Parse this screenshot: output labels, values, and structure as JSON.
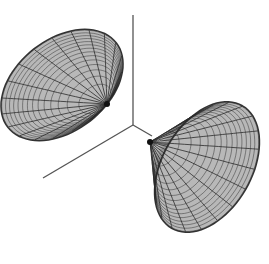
{
  "figure": {
    "background": "#ffffff",
    "surface_fill": "#b8b8b8",
    "surface_edge_dark": "#333333",
    "mesh_color": "#2a2a2a",
    "axis_color": "#555555",
    "axes": {
      "origin": [
        133,
        125
      ],
      "z_end": [
        133,
        15
      ],
      "x_end": [
        43,
        178
      ],
      "y_end": [
        152,
        136
      ]
    },
    "dishes": [
      {
        "name": "upper-left-dish",
        "cx": 62,
        "cy": 85,
        "rx": 68,
        "ry": 45,
        "rotate": -38,
        "apex": [
          107,
          104
        ],
        "radial_lines": 20,
        "rings": 14
      },
      {
        "name": "lower-right-dish",
        "cx": 207,
        "cy": 167,
        "rx": 70,
        "ry": 44,
        "rotate": -60,
        "apex": [
          150,
          142
        ],
        "radial_lines": 20,
        "rings": 14
      }
    ]
  }
}
